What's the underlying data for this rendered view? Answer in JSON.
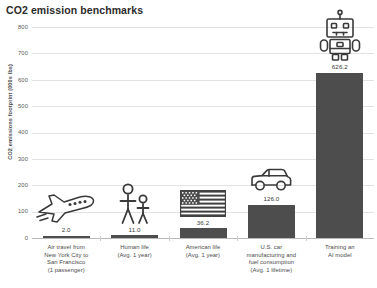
{
  "chart_data": {
    "type": "bar",
    "title": "CO2 emission benchmarks",
    "xlabel": "",
    "ylabel": "CO2 emissions footprint (000s lbs)",
    "ylim": [
      0,
      800
    ],
    "yticks": [
      0,
      100,
      200,
      300,
      400,
      500,
      600,
      700,
      800
    ],
    "ytick_labels": [
      "0",
      "100",
      "200",
      "300",
      "400",
      "500",
      "600",
      "700",
      "800"
    ],
    "grid": true,
    "legend": "none",
    "bar_color": "#4d4d4d",
    "categories": [
      "Air travel from New York City to San Francisco (1 passenger)",
      "Human life (Avg. 1 year)",
      "American life (Avg. 1 year)",
      "U.S. car manufacturing and fuel consumption (Avg. 1 lifetime)",
      "Training an AI model"
    ],
    "category_lines": [
      [
        "Air travel from",
        "New York City to",
        "San Francisco",
        "(1 passenger)"
      ],
      [
        "Human life",
        "(Avg. 1 year)"
      ],
      [
        "American life",
        "(Avg. 1 year)"
      ],
      [
        "U.S. car",
        "manufacturing and",
        "fuel consumption",
        "(Avg. 1 lifetime)"
      ],
      [
        "Training an",
        "AI model"
      ]
    ],
    "values": [
      2.0,
      11.0,
      36.2,
      126.0,
      626.2
    ],
    "value_labels": [
      "2.0",
      "11.0",
      "36.2",
      "126.0",
      "626.2"
    ],
    "icons": [
      "airplane-icon",
      "people-icon",
      "us-flag-icon",
      "car-icon",
      "robot-icon"
    ]
  }
}
